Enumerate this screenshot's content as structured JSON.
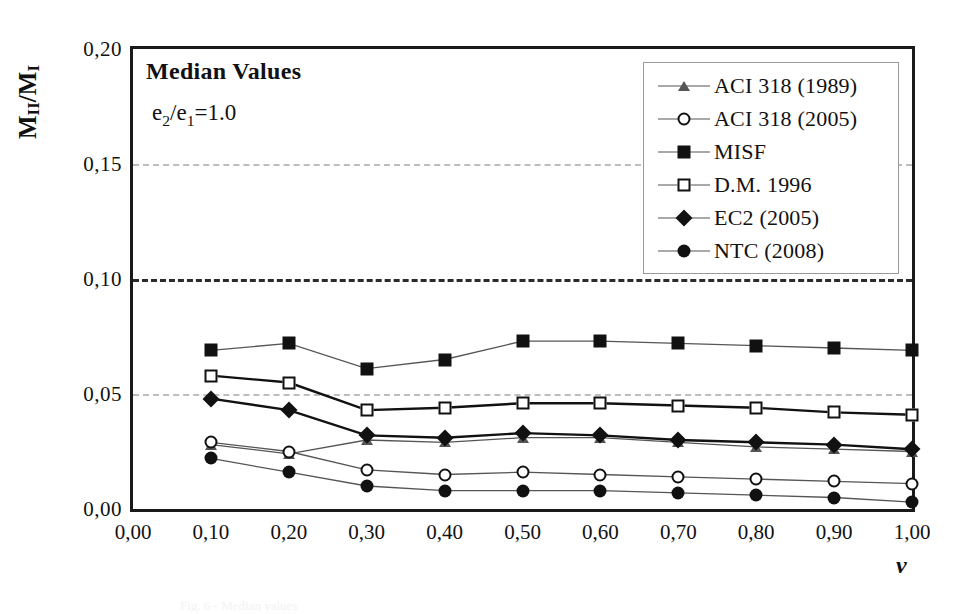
{
  "figure": {
    "annotation_title": "Median Values",
    "annotation_subtitle_prefix": "e",
    "annotation_subtitle": "e2/e1=1.0",
    "caption_remnant": "Fig. 6 - Median values"
  },
  "axes": {
    "ylabel": "MII/MI",
    "xlabel": "ν",
    "yticks": [
      "0,20",
      "0,15",
      "0,10",
      "0,05",
      "0,00"
    ],
    "ytick_values": [
      0.2,
      0.15,
      0.1,
      0.05,
      0.0
    ],
    "xticks": [
      "0,00",
      "0,10",
      "0,20",
      "0,30",
      "0,40",
      "0,50",
      "0,60",
      "0,70",
      "0,80",
      "0,90",
      "1,00"
    ],
    "xtick_values": [
      0.0,
      0.1,
      0.2,
      0.3,
      0.4,
      0.5,
      0.6,
      0.7,
      0.8,
      0.9,
      1.0
    ],
    "ylim": [
      0.0,
      0.2
    ],
    "xlim": [
      0.0,
      1.0
    ]
  },
  "legend": {
    "position": "top-right",
    "items": [
      {
        "label": "ACI 318 (1989)",
        "marker": "triangle-open"
      },
      {
        "label": "ACI 318 (2005)",
        "marker": "circle-open"
      },
      {
        "label": "MISF",
        "marker": "square-filled"
      },
      {
        "label": "D.M. 1996",
        "marker": "square-open"
      },
      {
        "label": "EC2 (2005)",
        "marker": "diamond-filled"
      },
      {
        "label": "NTC (2008)",
        "marker": "circle-filled"
      }
    ]
  },
  "colors": {
    "line": "#555555",
    "line_dark": "#111111",
    "frame": "#1a1a1a",
    "grid": "#bdbdbd",
    "grid_major": "#2b2b2b",
    "background": "#ffffff"
  },
  "chart_data": {
    "type": "line",
    "title": "Median Values",
    "xlabel": "ν",
    "ylabel": "MII/MI",
    "xlim": [
      0.0,
      1.0
    ],
    "ylim": [
      0.0,
      0.2
    ],
    "grid": true,
    "legend_position": "top-right",
    "x": [
      0.1,
      0.2,
      0.3,
      0.4,
      0.5,
      0.6,
      0.7,
      0.8,
      0.9,
      1.0
    ],
    "series": [
      {
        "name": "ACI 318 (1989)",
        "marker": "triangle-open",
        "values": [
          0.028,
          0.024,
          0.03,
          0.029,
          0.031,
          0.031,
          0.029,
          0.027,
          0.026,
          0.025
        ]
      },
      {
        "name": "ACI 318 (2005)",
        "marker": "circle-open",
        "values": [
          0.029,
          0.025,
          0.017,
          0.015,
          0.016,
          0.015,
          0.014,
          0.013,
          0.012,
          0.011
        ]
      },
      {
        "name": "MISF",
        "marker": "square-filled",
        "values": [
          0.069,
          0.072,
          0.061,
          0.065,
          0.073,
          0.073,
          0.072,
          0.071,
          0.07,
          0.069
        ]
      },
      {
        "name": "D.M. 1996",
        "marker": "square-open",
        "values": [
          0.058,
          0.055,
          0.043,
          0.044,
          0.046,
          0.046,
          0.045,
          0.044,
          0.042,
          0.041
        ]
      },
      {
        "name": "EC2 (2005)",
        "marker": "diamond-filled",
        "values": [
          0.048,
          0.043,
          0.032,
          0.031,
          0.033,
          0.032,
          0.03,
          0.029,
          0.028,
          0.026
        ]
      },
      {
        "name": "NTC (2008)",
        "marker": "circle-filled",
        "values": [
          0.022,
          0.016,
          0.01,
          0.008,
          0.008,
          0.008,
          0.007,
          0.006,
          0.005,
          0.003
        ]
      }
    ]
  }
}
